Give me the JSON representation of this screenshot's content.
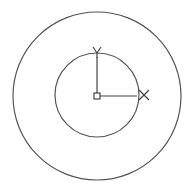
{
  "drawing": {
    "background": "#ffffff",
    "stroke_color": "#555555",
    "outer_circle": {
      "cx": 97,
      "cy": 96,
      "r": 84
    },
    "inner_circle": {
      "cx": 97,
      "cy": 95,
      "r": 42
    },
    "ucs_icon": {
      "origin": {
        "x": 97,
        "y": 96
      },
      "origin_box_size": 6,
      "x_axis": {
        "label": "X",
        "length": 40
      },
      "y_axis": {
        "label": "Y",
        "length": 39
      }
    }
  }
}
